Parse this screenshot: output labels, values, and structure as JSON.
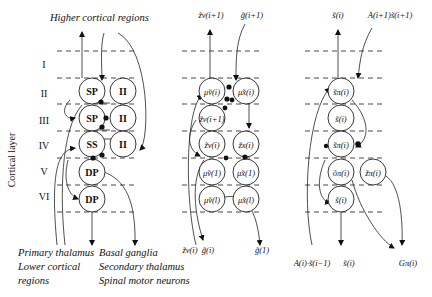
{
  "figure": {
    "axis_label": "Cortical layer",
    "layers": [
      "I",
      "II",
      "III",
      "IV",
      "V",
      "VI"
    ],
    "top_label": "Higher cortical regions",
    "bottom_labels": {
      "left": [
        "Primary thalamus",
        "Lower cortical",
        "regions"
      ],
      "right": [
        "Basal ganglia",
        "Secondary thalamus",
        "Spinal motor neurons"
      ]
    }
  },
  "panels": {
    "anatomy": {
      "nodes": {
        "sp_ii": "SP",
        "ii_ii": "II",
        "sp_iii": "SP",
        "ii_iii": "II",
        "ss_iv": "SS",
        "ii_iv": "II",
        "dp_v": "DP",
        "dp_vi": "DP"
      }
    },
    "predictive_coding": {
      "top_left": "z̃v(i+1)",
      "top_right": "g̃(i+1)",
      "bottom_left_a": "z̃v(i)",
      "bottom_left_b": "g̃(i)",
      "bottom_right": "g̃(1)",
      "nodes": {
        "mu_v_i": "μ̃v(i)",
        "mu_x_i": "μ̃x(i)",
        "z_v_i1": "z̃v(i+1)",
        "z_v_i": "z̃v(i)",
        "z_x_i": "z̃x(i)",
        "mu_v_1": "μ̃v(1)",
        "mu_x_1": "μ̃x(1)",
        "mu_v_l": "μ̃v(l)",
        "mu_x_l": "μ̃x(l)"
      }
    },
    "tensor": {
      "top_left": "s̃(i)",
      "top_right": "A(i+1)s̃(i+1)",
      "bottom_left": "A(i)·s̃(i−1)",
      "bottom_mid": "s̃(i)",
      "bottom_right": "Gπ(i)",
      "nodes": {
        "s_pi_1": "s̃π(i)",
        "s_2": "s̃(i)",
        "s_pi_3": "s̃π(i)",
        "o_pi": "õπ(i)",
        "z_pi": "z̃π(i)",
        "s_bottom": "s̃(i)"
      }
    }
  }
}
